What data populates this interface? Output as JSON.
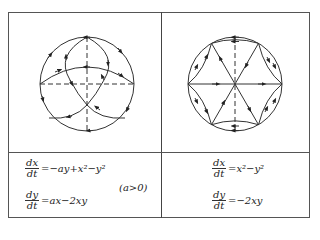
{
  "panels": [
    {
      "id": "left",
      "equations": [
        {
          "num": "dx",
          "den": "dt",
          "rhs": "=−ay+x²−y²"
        },
        {
          "num": "dy",
          "den": "dt",
          "rhs": "=ax−2xy"
        }
      ],
      "condition": "(a>0)"
    },
    {
      "id": "right",
      "equations": [
        {
          "num": "dx",
          "den": "dt",
          "rhs": "=x²−y²"
        },
        {
          "num": "dy",
          "den": "dt",
          "rhs": "=−2xy"
        }
      ]
    }
  ],
  "colors": {
    "line": "#333333",
    "border": "#555555",
    "background": "#ffffff"
  }
}
